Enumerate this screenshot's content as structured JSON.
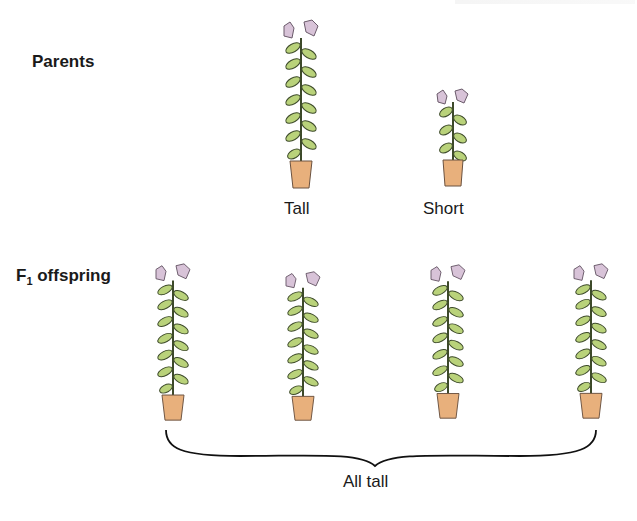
{
  "rows": {
    "parents": {
      "label": "Parents",
      "plants": [
        {
          "name": "tall-parent",
          "caption": "Tall",
          "height": "tall"
        },
        {
          "name": "short-parent",
          "caption": "Short",
          "height": "short"
        }
      ]
    },
    "f1": {
      "label_main": "F",
      "label_sub": "1",
      "label_rest": " offspring",
      "plants": [
        {
          "name": "f1-plant-1",
          "height": "tall"
        },
        {
          "name": "f1-plant-2",
          "height": "tall"
        },
        {
          "name": "f1-plant-3",
          "height": "tall"
        },
        {
          "name": "f1-plant-4",
          "height": "tall"
        }
      ],
      "brace_caption": "All tall"
    }
  },
  "colors": {
    "leaf": "#b9d27a",
    "leaf_stroke": "#3d4a2a",
    "flower": "#d8c3d8",
    "pot": "#e8b07c",
    "pot_stroke": "#6b5240",
    "brace": "#111111"
  }
}
